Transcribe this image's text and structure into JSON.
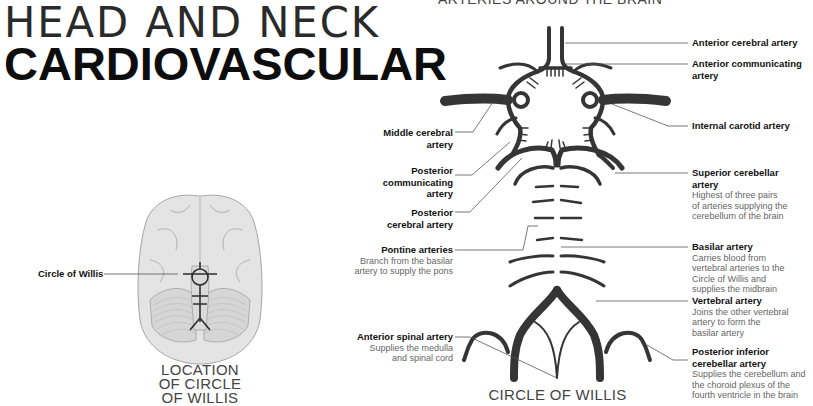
{
  "header": {
    "title_line1": "HEAD AND NECK",
    "title_line2": "CARDIOVASCULAR",
    "section_heading": "ARTERIES AROUND THE BRAIN"
  },
  "location_panel": {
    "label": "Circle of Willis",
    "caption_lines": [
      "LOCATION",
      "OF CIRCLE",
      "OF WILLIS"
    ]
  },
  "main_diagram": {
    "caption": "CIRCLE OF WILLIS",
    "left_labels": [
      {
        "name": "Middle cerebral artery",
        "lines": [
          "Middle cerebral",
          "artery"
        ],
        "desc": []
      },
      {
        "name": "Posterior communicating artery",
        "lines": [
          "Posterior",
          "communicating",
          "artery"
        ],
        "desc": []
      },
      {
        "name": "Posterior cerebral artery",
        "lines": [
          "Posterior",
          "cerebral artery"
        ],
        "desc": []
      },
      {
        "name": "Pontine arteries",
        "lines": [
          "Pontine arteries"
        ],
        "desc": [
          "Branch from the basilar",
          "artery to supply the pons"
        ]
      },
      {
        "name": "Anterior spinal artery",
        "lines": [
          "Anterior spinal artery"
        ],
        "desc": [
          "Supplies the medulla",
          "and spinal cord"
        ]
      }
    ],
    "right_labels": [
      {
        "name": "Anterior cerebral artery",
        "lines": [
          "Anterior cerebral artery"
        ],
        "desc": []
      },
      {
        "name": "Anterior communicating artery",
        "lines": [
          "Anterior communicating",
          "artery"
        ],
        "desc": []
      },
      {
        "name": "Internal carotid artery",
        "lines": [
          "Internal carotid artery"
        ],
        "desc": []
      },
      {
        "name": "Superior cerebellar artery",
        "lines": [
          "Superior cerebellar",
          "artery"
        ],
        "desc": [
          "Highest of three pairs",
          "of arteries supplying the",
          "cerebellum of the brain"
        ]
      },
      {
        "name": "Basilar artery",
        "lines": [
          "Basilar artery"
        ],
        "desc": [
          "Carries blood from",
          "vertebral arteries to the",
          "Circle of Willis and",
          "supplies the midbrain"
        ]
      },
      {
        "name": "Vertebral artery",
        "lines": [
          "Vertebral artery"
        ],
        "desc": [
          "Joins the other vertebral",
          "artery to form the",
          "basilar artery"
        ]
      },
      {
        "name": "Posterior inferior cerebellar artery",
        "lines": [
          "Posterior inferior",
          "cerebellar artery"
        ],
        "desc": [
          "Supplies the cerebellum and",
          "the choroid plexus of the",
          "fourth ventricle in the brain"
        ]
      }
    ]
  },
  "colors": {
    "artery": "#3a3a3a",
    "artery_highlight": "#8a8a8a",
    "brain_fill": "#e2e2e2",
    "brain_stroke": "#a8a8a8",
    "leader_line": "#555555"
  }
}
